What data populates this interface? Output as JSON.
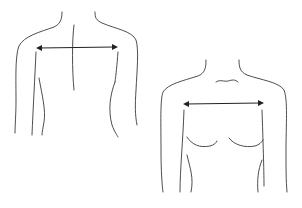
{
  "diagram": {
    "type": "measurement-illustration",
    "figures": [
      {
        "id": "back-view",
        "measurement": "shoulder-width"
      },
      {
        "id": "front-view",
        "measurement": "shoulder-width"
      }
    ],
    "colors": {
      "background": "#ffffff",
      "line": "#3a3a3a",
      "arrow": "#222222"
    }
  }
}
